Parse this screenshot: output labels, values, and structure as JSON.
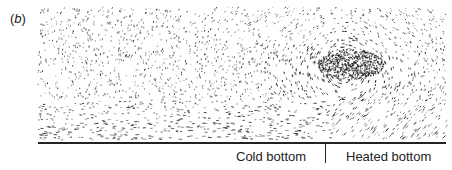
{
  "figure": {
    "panel_label": "(b)",
    "bottom_labels": {
      "cold": "Cold bottom",
      "heated": "Heated bottom"
    },
    "colors": {
      "ink": "#222222",
      "background": "#ffffff"
    }
  }
}
